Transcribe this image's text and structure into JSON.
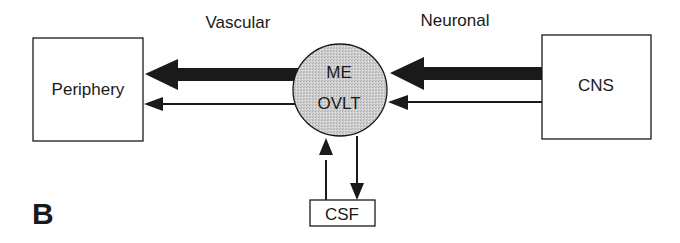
{
  "panel_label": "B",
  "headings": {
    "vascular": "Vascular",
    "neuronal": "Neuronal"
  },
  "nodes": {
    "periphery": "Periphery",
    "cns": "CNS",
    "center_line1": "ME",
    "center_line2": "OVLT",
    "csf": "CSF"
  },
  "colors": {
    "stroke": "#1a1a1a",
    "circle_fill": "#c8c8c8",
    "background": "#ffffff"
  },
  "edges": [
    {
      "from": "CNS",
      "to": "ME/OVLT",
      "weight": "thick"
    },
    {
      "from": "CNS",
      "to": "ME/OVLT",
      "weight": "thin"
    },
    {
      "from": "ME/OVLT",
      "to": "Periphery",
      "weight": "thick"
    },
    {
      "from": "ME/OVLT",
      "to": "Periphery",
      "weight": "thin"
    },
    {
      "from": "CSF",
      "to": "ME/OVLT",
      "weight": "thin"
    },
    {
      "from": "ME/OVLT",
      "to": "CSF",
      "weight": "thin"
    }
  ]
}
